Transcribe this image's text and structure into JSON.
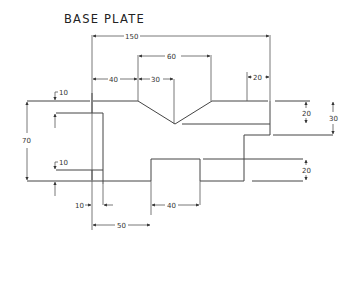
{
  "drawing": {
    "title": "BASE PLATE",
    "stroke_color": "#444444",
    "background": "#ffffff"
  },
  "dimensions": {
    "overall_width": "150",
    "vnotch_width": "60",
    "left_offset": "40",
    "vnotch_half": "30",
    "right_step": "20",
    "top_edge": "10",
    "overall_height": "70",
    "lower_edge": "10",
    "right_upper": "20",
    "right_total": "30",
    "right_lower": "20",
    "bottom_left_small": "10",
    "bottom_slot": "40",
    "bottom_left_width": "50"
  }
}
